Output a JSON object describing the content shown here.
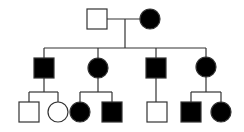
{
  "diagram": {
    "type": "pedigree",
    "colors": {
      "line": "#333333",
      "affected": "#000000",
      "unaffected_fill": "#ffffff",
      "background": "#ffffff"
    },
    "generations": [
      {
        "label": "I",
        "individuals": [
          {
            "id": "I-1",
            "sex": "male",
            "affected": false,
            "x": 97,
            "y": 19
          },
          {
            "id": "I-2",
            "sex": "female",
            "affected": true,
            "x": 150,
            "y": 19
          }
        ]
      },
      {
        "label": "II",
        "individuals": [
          {
            "id": "II-1",
            "sex": "male",
            "affected": true,
            "x": 44,
            "y": 68
          },
          {
            "id": "II-2",
            "sex": "female",
            "affected": true,
            "x": 98,
            "y": 68
          },
          {
            "id": "II-3",
            "sex": "male",
            "affected": true,
            "x": 156,
            "y": 68
          },
          {
            "id": "II-4",
            "sex": "female",
            "affected": true,
            "x": 206,
            "y": 67
          }
        ]
      },
      {
        "label": "III",
        "individuals": [
          {
            "id": "III-1",
            "sex": "male",
            "affected": false,
            "x": 29,
            "y": 112,
            "parent": "II-1"
          },
          {
            "id": "III-2",
            "sex": "female",
            "affected": false,
            "x": 58,
            "y": 112,
            "parent": "II-1"
          },
          {
            "id": "III-3",
            "sex": "female",
            "affected": true,
            "x": 80,
            "y": 112,
            "parent": "II-2"
          },
          {
            "id": "III-4",
            "sex": "male",
            "affected": true,
            "x": 112,
            "y": 112,
            "parent": "II-2"
          },
          {
            "id": "III-5",
            "sex": "male",
            "affected": false,
            "x": 157,
            "y": 112,
            "parent": "II-3"
          },
          {
            "id": "III-6",
            "sex": "male",
            "affected": true,
            "x": 191,
            "y": 112,
            "parent": "II-4"
          },
          {
            "id": "III-7",
            "sex": "female",
            "affected": true,
            "x": 221,
            "y": 112,
            "parent": "II-4"
          }
        ]
      }
    ]
  }
}
